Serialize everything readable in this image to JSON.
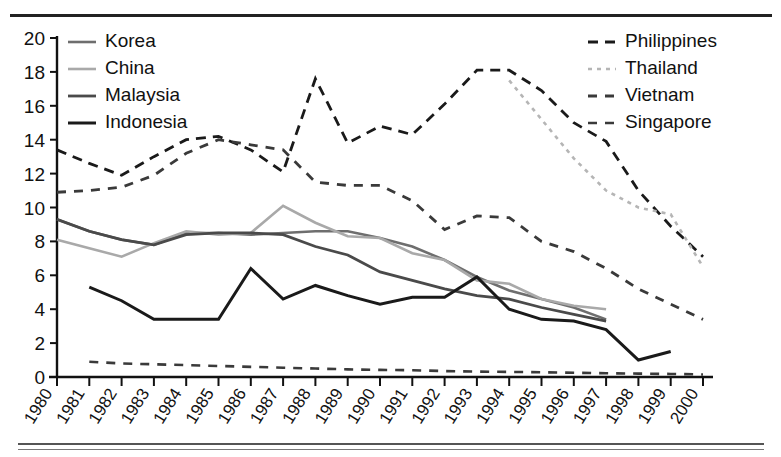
{
  "figure": {
    "title": "",
    "top_rule": "horizontal-rule",
    "bottom_rule": "horizontal-rule"
  },
  "chart_data": {
    "type": "line",
    "title": "",
    "xlabel": "",
    "ylabel": "",
    "grid": false,
    "xlim": [
      1980,
      2000
    ],
    "ylim": [
      0,
      20
    ],
    "yticks": [
      0,
      2,
      4,
      6,
      8,
      10,
      12,
      14,
      16,
      18,
      20
    ],
    "x": [
      1980,
      1981,
      1982,
      1983,
      1984,
      1985,
      1986,
      1987,
      1988,
      1989,
      1990,
      1991,
      1992,
      1993,
      1994,
      1995,
      1996,
      1997,
      1998,
      1999,
      2000
    ],
    "categories": [
      "1980",
      "1981",
      "1982",
      "1983",
      "1984",
      "1985",
      "1986",
      "1987",
      "1988",
      "1989",
      "1990",
      "1991",
      "1992",
      "1993",
      "1994",
      "1995",
      "1996",
      "1997",
      "1998",
      "1999",
      "2000"
    ],
    "legend_position": "inside-top-left and inside-top-right",
    "series": [
      {
        "name": "Korea",
        "color": "#6e6e6e",
        "width": 2.6,
        "dash": "none",
        "legend_column": "left",
        "x": [
          1980,
          1981,
          1982,
          1983,
          1984,
          1985,
          1986,
          1987,
          1988,
          1989,
          1990,
          1991,
          1992,
          1993,
          1994,
          1995,
          1996,
          1997
        ],
        "values": [
          9.3,
          8.6,
          8.1,
          7.8,
          8.5,
          8.5,
          8.4,
          8.5,
          8.6,
          8.6,
          8.2,
          7.7,
          6.9,
          5.9,
          5.1,
          4.6,
          4.1,
          3.4
        ]
      },
      {
        "name": "China",
        "color": "#a9a9a9",
        "width": 2.6,
        "dash": "none",
        "legend_column": "left",
        "x": [
          1980,
          1981,
          1982,
          1983,
          1984,
          1985,
          1986,
          1987,
          1988,
          1989,
          1990,
          1991,
          1992,
          1993,
          1994,
          1995,
          1996,
          1997
        ],
        "values": [
          8.1,
          7.6,
          7.1,
          7.9,
          8.6,
          8.4,
          8.5,
          10.1,
          9.1,
          8.3,
          8.2,
          7.3,
          6.9,
          5.7,
          5.5,
          4.6,
          4.2,
          4.0
        ]
      },
      {
        "name": "Malaysia",
        "color": "#4a4a4a",
        "width": 2.8,
        "dash": "none",
        "legend_column": "left",
        "x": [
          1980,
          1981,
          1982,
          1983,
          1984,
          1985,
          1986,
          1987,
          1988,
          1989,
          1990,
          1991,
          1992,
          1993,
          1994,
          1995,
          1996,
          1997
        ],
        "values": [
          9.3,
          8.6,
          8.1,
          7.8,
          8.4,
          8.5,
          8.5,
          8.4,
          7.7,
          7.2,
          6.2,
          5.7,
          5.2,
          4.8,
          4.6,
          4.1,
          3.7,
          3.3
        ]
      },
      {
        "name": "Indonesia",
        "color": "#1a1a1a",
        "width": 3.0,
        "dash": "none",
        "legend_column": "left",
        "x": [
          1981,
          1982,
          1983,
          1984,
          1985,
          1986,
          1987,
          1988,
          1989,
          1990,
          1991,
          1992,
          1993,
          1994,
          1995,
          1996,
          1997,
          1998,
          1999
        ],
        "values": [
          5.3,
          4.5,
          3.4,
          3.4,
          3.4,
          6.4,
          4.6,
          5.4,
          4.8,
          4.3,
          4.7,
          4.7,
          5.9,
          4.0,
          3.4,
          3.3,
          2.8,
          1.0,
          1.5
        ]
      },
      {
        "name": "Philippines",
        "color": "#1a1a1a",
        "width": 2.8,
        "dash": "10,7",
        "legend_column": "right",
        "x": [
          1980,
          1981,
          1982,
          1983,
          1984,
          1985,
          1986,
          1987,
          1988,
          1989,
          1990,
          1991,
          1992,
          1993,
          1994,
          1995,
          1996,
          1997,
          1998,
          1999,
          2000
        ],
        "values": [
          13.4,
          12.6,
          11.9,
          13.0,
          14.0,
          14.2,
          13.4,
          12.1,
          17.6,
          13.8,
          14.8,
          14.3,
          16.1,
          18.1,
          18.1,
          16.9,
          15.0,
          13.9,
          11.0,
          8.9,
          7.1
        ]
      },
      {
        "name": "Thailand",
        "color": "#b5b5b5",
        "width": 2.6,
        "dash": "4,5",
        "legend_column": "right",
        "x": [
          1994,
          1995,
          1996,
          1997,
          1998,
          1999,
          2000
        ],
        "values": [
          17.5,
          15.2,
          12.9,
          11.0,
          10.0,
          9.6,
          6.5
        ]
      },
      {
        "name": "Vietnam",
        "color": "#3a3a3a",
        "width": 2.8,
        "dash": "9,8",
        "legend_column": "right",
        "x": [
          1980,
          1981,
          1982,
          1983,
          1984,
          1985,
          1986,
          1987,
          1988,
          1989,
          1990,
          1991,
          1992,
          1993,
          1994,
          1995,
          1996,
          1997,
          1998,
          1999,
          2000
        ],
        "values": [
          10.9,
          11.0,
          11.2,
          11.9,
          13.2,
          14.0,
          13.7,
          13.4,
          11.5,
          11.3,
          11.3,
          10.4,
          8.7,
          9.5,
          9.4,
          8.0,
          7.4,
          6.4,
          5.2,
          4.3,
          3.4
        ]
      },
      {
        "name": "Singapore",
        "color": "#3a3a3a",
        "width": 2.6,
        "dash": "9,8",
        "legend_column": "right",
        "x": [
          1981,
          1982,
          1983,
          1984,
          1985,
          1986,
          1987,
          1988,
          1989,
          1990,
          1991,
          1992,
          1993,
          1994,
          1995,
          1996,
          1997,
          1998,
          1999,
          2000
        ],
        "values": [
          0.9,
          0.8,
          0.75,
          0.7,
          0.65,
          0.6,
          0.55,
          0.5,
          0.45,
          0.42,
          0.4,
          0.35,
          0.32,
          0.3,
          0.28,
          0.25,
          0.22,
          0.2,
          0.18,
          0.15
        ]
      }
    ]
  },
  "axes": {
    "y_tick_labels": [
      "20",
      "18",
      "16",
      "14",
      "12",
      "10",
      "8",
      "6",
      "4",
      "2",
      "0"
    ],
    "x_tick_labels": [
      "1980",
      "1981",
      "1982",
      "1983",
      "1984",
      "1985",
      "1986",
      "1987",
      "1988",
      "1989",
      "1990",
      "1991",
      "1992",
      "1993",
      "1994",
      "1995",
      "1996",
      "1997",
      "1998",
      "1999",
      "2000"
    ]
  },
  "legend": {
    "left": [
      {
        "label": "Korea"
      },
      {
        "label": "China"
      },
      {
        "label": "Malaysia"
      },
      {
        "label": "Indonesia"
      }
    ],
    "right": [
      {
        "label": "Philippines"
      },
      {
        "label": "Thailand"
      },
      {
        "label": "Vietnam"
      },
      {
        "label": "Singapore"
      }
    ]
  }
}
